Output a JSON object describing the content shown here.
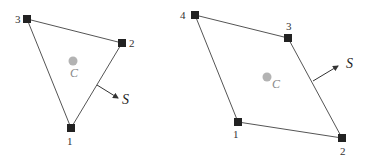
{
  "diagrams": [
    {
      "name": "triangle",
      "vertices": [
        {
          "label": "1",
          "x": 71,
          "y": 128,
          "lx": 67,
          "ly": 145
        },
        {
          "label": "2",
          "x": 122,
          "y": 43,
          "lx": 129,
          "ly": 47
        },
        {
          "label": "3",
          "x": 27,
          "y": 19,
          "lx": 15,
          "ly": 23
        }
      ],
      "centroid": {
        "label": "C",
        "x": 73,
        "y": 61,
        "lx": 70,
        "ly": 77
      },
      "normal": {
        "label": "S",
        "x1": 97,
        "y1": 85,
        "x2": 118,
        "y2": 98,
        "lx": 122,
        "ly": 104
      }
    },
    {
      "name": "quadrilateral",
      "vertices": [
        {
          "label": "1",
          "x": 238,
          "y": 122,
          "lx": 233,
          "ly": 138
        },
        {
          "label": "2",
          "x": 342,
          "y": 138,
          "lx": 340,
          "ly": 155
        },
        {
          "label": "3",
          "x": 288,
          "y": 38,
          "lx": 286,
          "ly": 30
        },
        {
          "label": "4",
          "x": 195,
          "y": 15,
          "lx": 180,
          "ly": 19
        }
      ],
      "centroid": {
        "label": "C",
        "x": 267,
        "y": 77,
        "lx": 272,
        "ly": 88
      },
      "normal": {
        "label": "S",
        "x1": 313,
        "y1": 81,
        "x2": 338,
        "y2": 66,
        "lx": 346,
        "ly": 68
      }
    }
  ]
}
